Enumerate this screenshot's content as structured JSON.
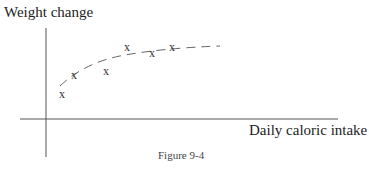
{
  "chart_data": {
    "type": "scatter",
    "title": "",
    "xlabel": "Daily caloric intake",
    "ylabel": "Weight change",
    "caption": "Figure 9-4",
    "grid": false,
    "legend": null,
    "marker": "x",
    "points_px": [
      {
        "x": 62,
        "y": 94
      },
      {
        "x": 74,
        "y": 75
      },
      {
        "x": 106,
        "y": 71
      },
      {
        "x": 127,
        "y": 47
      },
      {
        "x": 152,
        "y": 53
      },
      {
        "x": 172,
        "y": 47
      }
    ],
    "trend_curve": {
      "style": "dashed",
      "shape": "concave, rising then leveling off",
      "path": "M60,86 Q85,62 125,55 T220,46"
    },
    "axes_px": {
      "y_axis": {
        "x": 46,
        "y1": 28,
        "y2": 157
      },
      "x_axis": {
        "y": 119,
        "x1": 20,
        "x2": 338
      }
    }
  }
}
